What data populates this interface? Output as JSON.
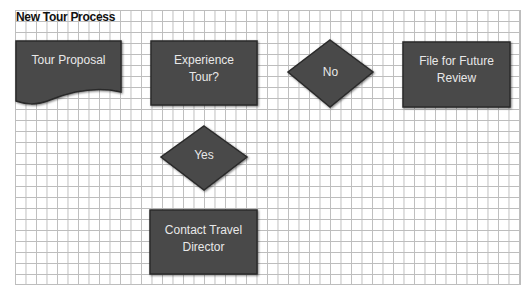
{
  "diagram": {
    "title": "New Tour Process",
    "colors": {
      "shape_fill": "#4a4a4a",
      "shape_stroke": "#2a2a2a",
      "text": "#e8e8e8",
      "grid_line": "#bdbdbd"
    },
    "nodes": [
      {
        "id": "tour-proposal",
        "type": "document",
        "label": "Tour Proposal"
      },
      {
        "id": "experience-tour",
        "type": "process",
        "label": "Experience\nTour?"
      },
      {
        "id": "no",
        "type": "decision",
        "label": "No"
      },
      {
        "id": "file-for-future-review",
        "type": "process",
        "label": "File for Future\nReview"
      },
      {
        "id": "yes",
        "type": "decision",
        "label": "Yes"
      },
      {
        "id": "contact-travel-director",
        "type": "process",
        "label": "Contact Travel\nDirector"
      }
    ]
  }
}
